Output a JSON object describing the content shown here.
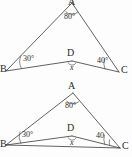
{
  "document": {
    "title": "Two geometry triangle diagrams",
    "background_color": "#fdfdfd",
    "line_color": "#3a3a3a"
  },
  "figures": [
    {
      "id": "figure-1",
      "name": "triangle-diagram-top",
      "has_base_line_bc": false,
      "apex_clipped": true,
      "vertices": {
        "A": "A",
        "B": "B",
        "C": "C",
        "D": "D"
      },
      "angles": {
        "at_a": "80°",
        "at_b": "30°",
        "at_c": "40°",
        "at_d": "x"
      }
    },
    {
      "id": "figure-2",
      "name": "triangle-diagram-bottom",
      "has_base_line_bc": true,
      "apex_clipped": false,
      "vertices": {
        "A": "A",
        "B": "B",
        "C": "C",
        "D": "D"
      },
      "angles": {
        "at_a": "80°",
        "at_b": "30°",
        "at_c": "40",
        "at_d": "x"
      }
    }
  ]
}
